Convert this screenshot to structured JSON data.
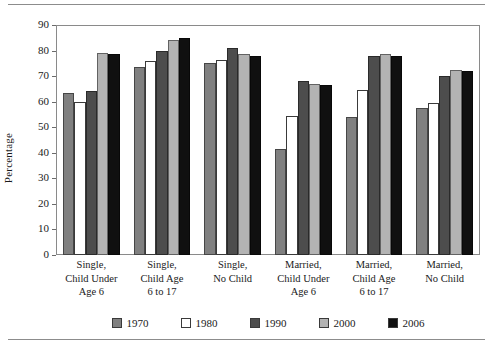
{
  "chart_data": {
    "type": "bar",
    "title": "",
    "xlabel": "",
    "ylabel": "Percentage",
    "ylim": [
      0,
      90
    ],
    "yticks": [
      0,
      10,
      20,
      30,
      40,
      50,
      60,
      70,
      80,
      90
    ],
    "grid": false,
    "legend_position": "bottom",
    "categories": [
      "Single,\nChild Under\nAge 6",
      "Single,\nChild Age\n6 to 17",
      "Single,\nNo Child",
      "Married,\nChild Under\nAge 6",
      "Married,\nChild Age\n6 to 17",
      "Married,\nNo Child"
    ],
    "category_lines": [
      [
        "Single,",
        "Child Under",
        "Age 6"
      ],
      [
        "Single,",
        "Child Age",
        "6 to 17"
      ],
      [
        "Single,",
        "No Child",
        ""
      ],
      [
        "Married,",
        "Child Under",
        "Age 6"
      ],
      [
        "Married,",
        "Child Age",
        "6 to 17"
      ],
      [
        "Married,",
        "No Child",
        ""
      ]
    ],
    "series": [
      {
        "name": "1970",
        "color": "#808080",
        "values": [
          63.5,
          73.5,
          75.0,
          41.5,
          54.0,
          57.5
        ]
      },
      {
        "name": "1980",
        "color": "#ffffff",
        "values": [
          60.0,
          76.0,
          76.5,
          54.5,
          64.5,
          59.5
        ]
      },
      {
        "name": "1990",
        "color": "#4d4d4d",
        "values": [
          64.0,
          80.0,
          81.0,
          68.0,
          78.0,
          70.0
        ]
      },
      {
        "name": "2000",
        "color": "#b3b3b3",
        "values": [
          79.0,
          84.0,
          78.5,
          67.0,
          78.5,
          72.5
        ]
      },
      {
        "name": "2006",
        "color": "#101010",
        "values": [
          78.5,
          85.0,
          78.0,
          66.5,
          78.0,
          72.0
        ]
      }
    ]
  },
  "legend": {
    "items": [
      {
        "label": "1970",
        "color": "#808080"
      },
      {
        "label": "1980",
        "color": "#ffffff"
      },
      {
        "label": "1990",
        "color": "#4d4d4d"
      },
      {
        "label": "2000",
        "color": "#b3b3b3"
      },
      {
        "label": "2006",
        "color": "#101010"
      }
    ]
  },
  "axis": {
    "y_title": "Percentage",
    "y_tick_labels": [
      "90",
      "80",
      "70",
      "60",
      "50",
      "40",
      "30",
      "20",
      "10",
      "0"
    ]
  }
}
